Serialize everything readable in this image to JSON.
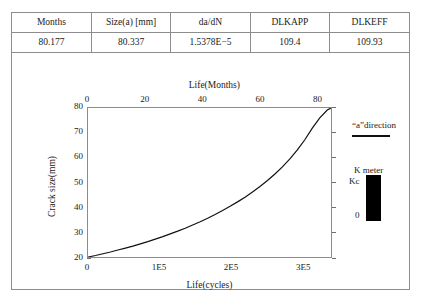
{
  "table": {
    "columns": [
      "Months",
      "Size(a) [mm]",
      "da/dN",
      "DLKAPP",
      "DLKEFF"
    ],
    "rows": [
      [
        "80.177",
        "80.337",
        "1.5378E−5",
        "109.4",
        "109.93"
      ]
    ]
  },
  "chart_data": {
    "type": "line",
    "title": "",
    "xlabel": "Life(cycles)",
    "ylabel": "Crack size(mm)",
    "top_xlabel": "Life(Months)",
    "xlim": [
      0,
      340000
    ],
    "ylim": [
      20,
      80
    ],
    "top_xlim": [
      0,
      85
    ],
    "grid": false,
    "legend_position": "right",
    "bottom_ticks": [
      {
        "value": 0,
        "label": "0"
      },
      {
        "value": 100000,
        "label": "1E5"
      },
      {
        "value": 200000,
        "label": "2E5"
      },
      {
        "value": 300000,
        "label": "3E5"
      }
    ],
    "top_ticks": [
      {
        "value": 0,
        "label": "0"
      },
      {
        "value": 20,
        "label": "20"
      },
      {
        "value": 40,
        "label": "40"
      },
      {
        "value": 60,
        "label": "60"
      },
      {
        "value": 80,
        "label": "80"
      }
    ],
    "y_ticks": [
      {
        "value": 80,
        "label": "80"
      },
      {
        "value": 70,
        "label": "70"
      },
      {
        "value": 60,
        "label": "60"
      },
      {
        "value": 50,
        "label": "50"
      },
      {
        "value": 40,
        "label": "40"
      },
      {
        "value": 30,
        "label": "30"
      },
      {
        "value": 20,
        "label": "20"
      }
    ],
    "series": [
      {
        "name": "“a”direction",
        "color": "#111111",
        "x": [
          0,
          10,
          20,
          30,
          40,
          50,
          60,
          70,
          80,
          90,
          100,
          110,
          120,
          130,
          140,
          150,
          160,
          170,
          180,
          190,
          200,
          210,
          220,
          230,
          240,
          250,
          260,
          270,
          280,
          290,
          300,
          310,
          320,
          325
        ],
        "x_units": "Months",
        "values": [
          20.0,
          20.6,
          21.3,
          22.0,
          22.8,
          23.6,
          24.4,
          25.3,
          26.2,
          27.2,
          28.2,
          29.3,
          30.4,
          31.6,
          32.9,
          34.2,
          35.6,
          37.1,
          38.7,
          40.4,
          42.2,
          44.1,
          46.2,
          48.4,
          50.8,
          53.4,
          56.3,
          59.5,
          63.1,
          67.2,
          71.9,
          76.0,
          79.2,
          80.0
        ]
      }
    ]
  },
  "legend": {
    "direction_label": "“a”direction",
    "kmeter_title": "K meter",
    "kmeter_top_label": "Kc",
    "kmeter_bottom_label": "0",
    "kmeter_fill_fraction": 1.0,
    "kmeter_color": "#000000"
  }
}
